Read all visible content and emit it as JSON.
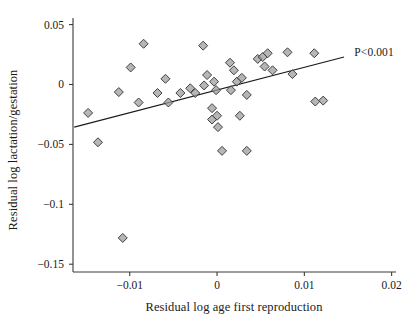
{
  "chart_data": {
    "type": "scatter",
    "title": "",
    "xlabel": "Residual log age first reproduction",
    "ylabel": "Residual log lactation/gestation",
    "xlim": [
      -0.0165,
      0.0205
    ],
    "ylim": [
      -0.1565,
      0.0555
    ],
    "xticks": [
      -0.01,
      0,
      0.01,
      0.02
    ],
    "xticklabels": [
      "−0.01",
      "0",
      "0.01",
      "0.02"
    ],
    "yticks": [
      0.05,
      0,
      -0.05,
      -0.1,
      -0.15
    ],
    "yticklabels": [
      "0.05",
      "0",
      "−0.05",
      "−0.1",
      "−0.15"
    ],
    "grid": false,
    "legend": false,
    "annotations": [
      {
        "text": "P<0.001",
        "x": 0.0155,
        "y": 0.0255
      }
    ],
    "marker": {
      "shape": "diamond",
      "fill": "#9a9a9a",
      "edge": "#404040",
      "size": 9
    },
    "fit_line": {
      "type": "linear",
      "color": "#1a1a1a",
      "x_start": -0.01636,
      "y_start": -0.03557,
      "x_end": 0.01455,
      "y_end": 0.02292
    },
    "points": [
      {
        "x": -0.01477,
        "y": -0.02372
      },
      {
        "x": -0.01364,
        "y": -0.04822
      },
      {
        "x": -0.0108,
        "y": -0.12806
      },
      {
        "x": -0.01125,
        "y": -0.00632
      },
      {
        "x": -0.00989,
        "y": 0.01423
      },
      {
        "x": -0.00898,
        "y": -0.01502
      },
      {
        "x": -0.00841,
        "y": 0.03399
      },
      {
        "x": -0.00682,
        "y": -0.00711
      },
      {
        "x": -0.00591,
        "y": 0.00474
      },
      {
        "x": -0.00557,
        "y": -0.01502
      },
      {
        "x": -0.0042,
        "y": -0.00711
      },
      {
        "x": -0.00307,
        "y": -0.00316
      },
      {
        "x": -0.0025,
        "y": -0.00711
      },
      {
        "x": -0.00159,
        "y": 0.03241
      },
      {
        "x": -0.00148,
        "y": -0.00079
      },
      {
        "x": -0.00114,
        "y": 0.0079
      },
      {
        "x": -0.00057,
        "y": -0.01976
      },
      {
        "x": -0.00057,
        "y": -0.02925
      },
      {
        "x": -0.00034,
        "y": 0.00237
      },
      {
        "x": -0.00011,
        "y": -0.00474
      },
      {
        "x": 0.0,
        "y": -0.02609
      },
      {
        "x": 0.00011,
        "y": -0.03557
      },
      {
        "x": 0.00057,
        "y": -0.05538
      },
      {
        "x": 0.00148,
        "y": 0.01818
      },
      {
        "x": 0.00159,
        "y": -0.00474
      },
      {
        "x": 0.00193,
        "y": 0.01186
      },
      {
        "x": 0.00227,
        "y": 0.00237
      },
      {
        "x": 0.00261,
        "y": -0.02609
      },
      {
        "x": 0.00284,
        "y": 0.00553
      },
      {
        "x": 0.00341,
        "y": -0.00869
      },
      {
        "x": 0.00466,
        "y": 0.02134
      },
      {
        "x": 0.00523,
        "y": 0.02292
      },
      {
        "x": 0.00545,
        "y": 0.01502
      },
      {
        "x": 0.0058,
        "y": 0.02609
      },
      {
        "x": 0.00636,
        "y": 0.01186
      },
      {
        "x": 0.00807,
        "y": 0.02688
      },
      {
        "x": 0.00864,
        "y": 0.00869
      },
      {
        "x": 0.01114,
        "y": 0.02609
      },
      {
        "x": 0.01125,
        "y": -0.01423
      },
      {
        "x": 0.01216,
        "y": -0.01344
      },
      {
        "x": 0.00341,
        "y": -0.05538
      }
    ]
  },
  "axes": {
    "left_px": 73,
    "right_px": 396,
    "top_px": 18,
    "bottom_px": 272
  }
}
